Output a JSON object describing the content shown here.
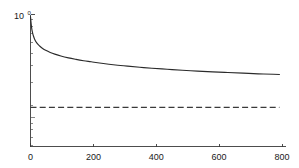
{
  "chart_data": {
    "type": "line",
    "title": "",
    "subtitle": "",
    "xlabel": "",
    "ylabel": "",
    "yscale": "log",
    "xscale": "linear",
    "grid": false,
    "legend": null,
    "xlim": [
      0,
      840
    ],
    "ylim": [
      0.055,
      1.05
    ],
    "xticks": [
      0,
      200,
      400,
      600,
      800
    ],
    "xtick_labels": [
      "0",
      "200",
      "400",
      "600",
      "800"
    ],
    "yticks": [
      1
    ],
    "ytick_labels": [
      "10^0"
    ],
    "ytick_mantissa": "10",
    "ytick_exponent": "0",
    "y_minor_ticks": [
      0.9,
      0.8,
      0.7,
      0.6,
      0.5,
      0.4,
      0.3,
      0.2,
      0.1,
      0.09,
      0.08,
      0.07,
      0.06
    ],
    "series": [
      {
        "name": "decay-curve",
        "style": "solid",
        "color": "#2b2b2b",
        "x": [
          0,
          2,
          4,
          6,
          8,
          10,
          14,
          18,
          24,
          30,
          40,
          50,
          65,
          80,
          100,
          125,
          150,
          175,
          200,
          240,
          280,
          320,
          360,
          400,
          450,
          500,
          550,
          600,
          650,
          700,
          750,
          800,
          820
        ],
        "y": [
          1.0,
          0.86,
          0.77,
          0.715,
          0.675,
          0.645,
          0.6,
          0.572,
          0.541,
          0.52,
          0.492,
          0.472,
          0.45,
          0.433,
          0.415,
          0.398,
          0.385,
          0.374,
          0.365,
          0.351,
          0.34,
          0.331,
          0.323,
          0.316,
          0.309,
          0.302,
          0.296,
          0.291,
          0.287,
          0.283,
          0.279,
          0.276,
          0.275
        ]
      },
      {
        "name": "reference-line",
        "style": "dashed",
        "color": "#3a3a3a",
        "x": [
          0,
          820
        ],
        "y": [
          0.132,
          0.132
        ]
      }
    ],
    "annotations": []
  }
}
